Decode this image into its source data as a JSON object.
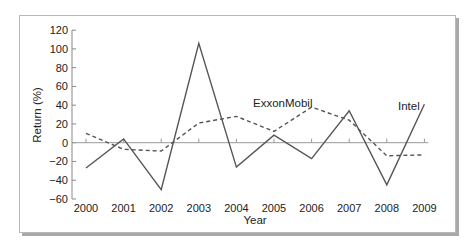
{
  "chart_data": {
    "type": "line",
    "title": "",
    "xlabel": "Year",
    "ylabel": "Return (%)",
    "ylim": [
      -60,
      120
    ],
    "yticks": [
      120,
      100,
      80,
      60,
      40,
      20,
      0,
      -20,
      -40,
      -60
    ],
    "categories": [
      "2000",
      "2001",
      "2002",
      "2003",
      "2004",
      "2005",
      "2006",
      "2007",
      "2008",
      "2009"
    ],
    "grid": false,
    "legend": "inline labels",
    "series": [
      {
        "name": "Intel",
        "style": "solid",
        "color": "#555555",
        "values": [
          -27,
          4,
          -50,
          106,
          -26,
          8,
          -17,
          34,
          -45,
          41
        ]
      },
      {
        "name": "ExxonMobil",
        "style": "dashed",
        "color": "#555555",
        "values": [
          10,
          -7,
          -9,
          21,
          28,
          12,
          38,
          24,
          -14,
          -13
        ]
      }
    ]
  },
  "labels": {
    "intel": "Intel",
    "exxon": "ExxonMobil",
    "xlabel": "Year",
    "ylabel": "Return (%)"
  }
}
